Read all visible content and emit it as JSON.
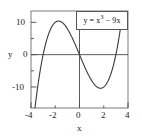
{
  "chart_data": {
    "type": "line",
    "title": "",
    "subtitle": "",
    "xlabel": "x",
    "ylabel": "y",
    "xlim": [
      -4,
      4
    ],
    "ylim": [
      -16.5,
      13.5
    ],
    "xticks": [
      -4,
      -2,
      0,
      2,
      4
    ],
    "xticklabels": [
      "-4",
      "-2",
      "0",
      "2",
      "4"
    ],
    "yticks": [
      -10,
      0,
      10
    ],
    "yticklabels": [
      "-10",
      "0",
      "10"
    ],
    "grid": false,
    "legend": "none",
    "annotations": [
      {
        "name": "equation-label",
        "text_base": "y = x",
        "text_exponent": "3",
        "text_tail": " − 9x",
        "boxed": true,
        "position": "upper-right"
      }
    ],
    "series": [
      {
        "name": "y = x^3 - 9x",
        "equation": "y = x**3 - 9*x",
        "color": "#3a3a3a",
        "linewidth": 1.1,
        "x": [
          -4.0,
          -3.8,
          -3.6,
          -3.4,
          -3.2,
          -3.0,
          -2.8,
          -2.6,
          -2.4,
          -2.2,
          -2.0,
          -1.8,
          -1.732,
          -1.6,
          -1.4,
          -1.2,
          -1.0,
          -0.8,
          -0.6,
          -0.4,
          -0.2,
          0.0,
          0.2,
          0.4,
          0.6,
          0.8,
          1.0,
          1.2,
          1.4,
          1.6,
          1.732,
          1.8,
          2.0,
          2.2,
          2.4,
          2.6,
          2.8,
          3.0,
          3.2,
          3.4,
          3.6,
          3.8,
          4.0
        ],
        "y": [
          -28.0,
          -20.67,
          -14.26,
          -8.7,
          -3.97,
          0.0,
          3.25,
          5.82,
          7.78,
          9.15,
          10.0,
          10.37,
          10.392,
          10.3,
          9.86,
          9.07,
          8.0,
          6.69,
          5.18,
          3.54,
          1.79,
          0.0,
          -1.79,
          -3.54,
          -5.18,
          -6.69,
          -8.0,
          -9.07,
          -9.86,
          -10.3,
          -10.392,
          -10.37,
          -10.0,
          -9.15,
          -7.78,
          -5.82,
          -3.25,
          0.0,
          3.97,
          8.7,
          14.26,
          20.67,
          28.0
        ],
        "critical_points": [
          {
            "label": "local-maximum",
            "x": -1.732,
            "y": 10.39
          },
          {
            "label": "local-minimum",
            "x": 1.732,
            "y": -10.39
          }
        ],
        "roots": [
          -3,
          0,
          3
        ]
      }
    ],
    "axis_lines": {
      "x_axis_at_y": 0,
      "y_axis_at_x": 0,
      "color": "#4a4a4a"
    },
    "frame": {
      "visible": true,
      "color": "#6a6a6a"
    }
  },
  "tick_labels": {
    "x": {
      "t0": "-4",
      "t1": "-2",
      "t2": "0",
      "t3": "2",
      "t4": "4"
    },
    "y": {
      "t0": "10",
      "t1": "0",
      "t2": "-10"
    }
  },
  "axis_titles": {
    "x": "x",
    "y": "y"
  },
  "equation": {
    "lhs": "y = x",
    "exponent": "3",
    "rhs": " − 9x"
  }
}
